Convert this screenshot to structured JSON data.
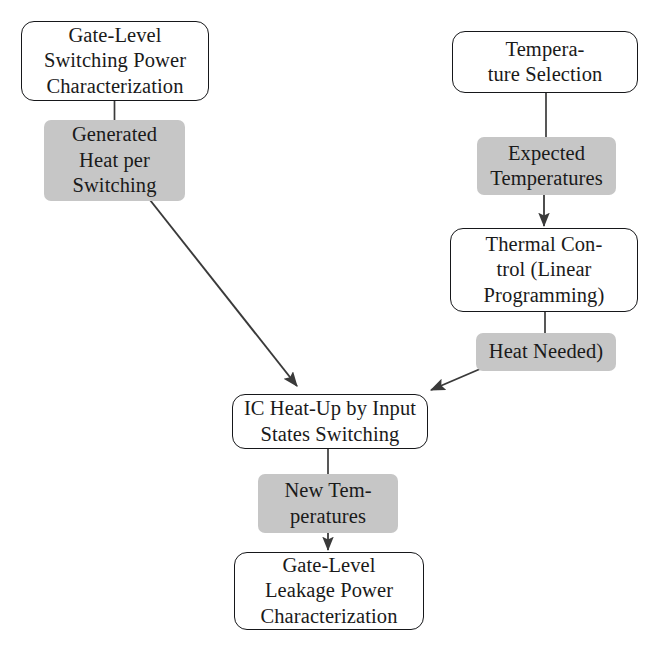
{
  "diagram": {
    "type": "flowchart",
    "canvas": {
      "width": 656,
      "height": 653
    },
    "colors": {
      "background": "#ffffff",
      "process_fill": "#ffffff",
      "process_stroke": "#16171a",
      "data_fill": "#c6c6c6",
      "edge_stroke": "#3a3a3a",
      "text": "#1a1a1a"
    },
    "nodes": [
      {
        "id": "gate-level-switching-power",
        "label": "Gate-Level\nSwitching Power\nCharacterization",
        "shape": "rounded-rect",
        "kind": "process",
        "x": 21,
        "y": 21,
        "w": 188,
        "h": 80
      },
      {
        "id": "generated-heat-per-switching",
        "label": "Generated\nHeat per\nSwitching",
        "shape": "rect",
        "kind": "data",
        "x": 44,
        "y": 120,
        "w": 141,
        "h": 81
      },
      {
        "id": "temperature-selection",
        "label": "Tempera-\nture Selection",
        "shape": "rounded-rect",
        "kind": "process",
        "x": 452,
        "y": 31,
        "w": 186,
        "h": 62
      },
      {
        "id": "expected-temperatures",
        "label": "Expected\nTemperatures",
        "shape": "rect",
        "kind": "data",
        "x": 477,
        "y": 137,
        "w": 139,
        "h": 58
      },
      {
        "id": "thermal-control",
        "label": "Thermal Con-\ntrol (Linear\nProgramming)",
        "shape": "rounded-rect",
        "kind": "process",
        "x": 450,
        "y": 228,
        "w": 188,
        "h": 84
      },
      {
        "id": "heat-needed",
        "label": "Heat Needed)",
        "shape": "rect",
        "kind": "data",
        "x": 476,
        "y": 333,
        "w": 140,
        "h": 38
      },
      {
        "id": "ic-heat-up",
        "label": "IC Heat-Up by Input\nStates Switching",
        "shape": "rounded-rect",
        "kind": "process",
        "x": 232,
        "y": 394,
        "w": 196,
        "h": 55
      },
      {
        "id": "new-temperatures",
        "label": "New Tem-\nperatures",
        "shape": "rect",
        "kind": "data",
        "x": 258,
        "y": 474,
        "w": 140,
        "h": 59
      },
      {
        "id": "gate-level-leakage-power",
        "label": "Gate-Level\nLeakage Power\nCharacterization",
        "shape": "rounded-rect",
        "kind": "process",
        "x": 234,
        "y": 552,
        "w": 190,
        "h": 78
      }
    ],
    "edges": [
      {
        "id": "edge-switching-to-generated-heat",
        "from": "gate-level-switching-power",
        "to": "generated-heat-per-switching",
        "arrowhead": false,
        "points": "114.5,101 114.5,120"
      },
      {
        "id": "edge-generated-heat-to-ic-heat-up",
        "from": "generated-heat-per-switching",
        "to": "ic-heat-up",
        "arrowhead": true,
        "points": "150,200 297,386"
      },
      {
        "id": "edge-temperature-selection-to-expected",
        "from": "temperature-selection",
        "to": "expected-temperatures",
        "arrowhead": false,
        "points": "546,93 546,137"
      },
      {
        "id": "edge-expected-to-thermal-control",
        "from": "expected-temperatures",
        "to": "thermal-control",
        "arrowhead": true,
        "points": "544,195 544,226"
      },
      {
        "id": "edge-thermal-control-to-heat-needed",
        "from": "thermal-control",
        "to": "heat-needed",
        "arrowhead": false,
        "points": "545,312 545,333"
      },
      {
        "id": "edge-heat-needed-to-ic-heat-up",
        "from": "heat-needed",
        "to": "ic-heat-up",
        "arrowhead": true,
        "points": "480,369 430,390"
      },
      {
        "id": "edge-ic-heat-up-to-new-temperatures",
        "from": "ic-heat-up",
        "to": "new-temperatures",
        "arrowhead": false,
        "points": "328,449 328,474"
      },
      {
        "id": "edge-new-temperatures-to-leakage",
        "from": "new-temperatures",
        "to": "gate-level-leakage-power",
        "arrowhead": true,
        "points": "328,533 328,550"
      }
    ]
  }
}
